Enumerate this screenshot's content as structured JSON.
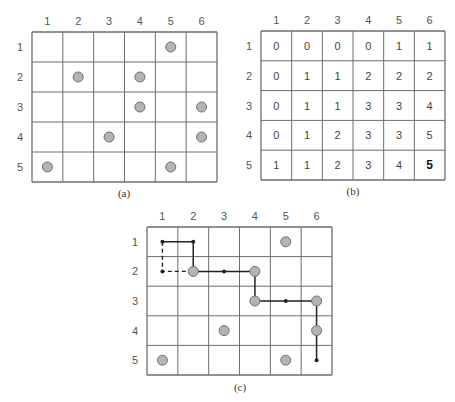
{
  "panels": {
    "a": {
      "caption": "(a)",
      "col_labels": [
        "1",
        "2",
        "3",
        "4",
        "5",
        "6"
      ],
      "row_labels": [
        "1",
        "2",
        "3",
        "4",
        "5"
      ],
      "coins": [
        [
          1,
          5
        ],
        [
          2,
          2
        ],
        [
          2,
          4
        ],
        [
          3,
          4
        ],
        [
          3,
          6
        ],
        [
          4,
          3
        ],
        [
          4,
          6
        ],
        [
          5,
          1
        ],
        [
          5,
          5
        ]
      ]
    },
    "b": {
      "caption": "(b)",
      "col_labels": [
        "1",
        "2",
        "3",
        "4",
        "5",
        "6"
      ],
      "row_labels": [
        "1",
        "2",
        "3",
        "4",
        "5"
      ],
      "values": [
        [
          "0",
          "0",
          "0",
          "0",
          "1",
          "1"
        ],
        [
          "0",
          "1",
          "1",
          "2",
          "2",
          "2"
        ],
        [
          "0",
          "1",
          "1",
          "3",
          "3",
          "4"
        ],
        [
          "0",
          "1",
          "2",
          "3",
          "3",
          "5"
        ],
        [
          "1",
          "1",
          "2",
          "3",
          "4",
          "5"
        ]
      ],
      "highlight_cell": [
        5,
        6
      ]
    },
    "c": {
      "caption": "(c)",
      "col_labels": [
        "1",
        "2",
        "3",
        "4",
        "5",
        "6"
      ],
      "row_labels": [
        "1",
        "2",
        "3",
        "4",
        "5"
      ],
      "coins": [
        [
          1,
          5
        ],
        [
          2,
          2
        ],
        [
          2,
          4
        ],
        [
          3,
          4
        ],
        [
          3,
          6
        ],
        [
          4,
          3
        ],
        [
          4,
          6
        ],
        [
          5,
          1
        ],
        [
          5,
          5
        ]
      ],
      "solid_path": [
        [
          1,
          1
        ],
        [
          1,
          2
        ],
        [
          2,
          2
        ],
        [
          2,
          3
        ],
        [
          2,
          4
        ],
        [
          3,
          4
        ],
        [
          3,
          5
        ],
        [
          3,
          6
        ],
        [
          4,
          6
        ],
        [
          5,
          6
        ]
      ],
      "dashed_path": [
        [
          1,
          1
        ],
        [
          2,
          1
        ],
        [
          2,
          2
        ]
      ],
      "path_dots": [
        [
          1,
          1
        ],
        [
          1,
          2
        ],
        [
          2,
          1
        ],
        [
          2,
          3
        ],
        [
          3,
          5
        ],
        [
          5,
          6
        ]
      ]
    }
  },
  "colors": {
    "grid_line": "#6e6e6e",
    "coin_fill": "#b4b4b4",
    "coin_stroke": "#707070",
    "path": "#222222"
  }
}
